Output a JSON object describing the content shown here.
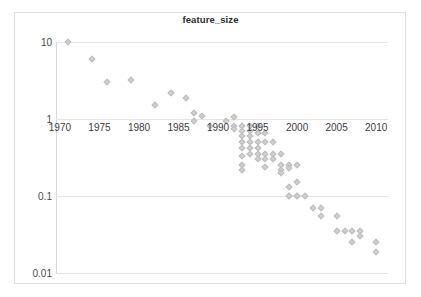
{
  "chart": {
    "title": "feature_size",
    "type": "scatter",
    "xlabel": "",
    "ylabel": "",
    "yscale": "log",
    "grid": true,
    "legend": "none"
  },
  "axes": {
    "x_ticks": [
      "1970",
      "1975",
      "1980",
      "1985",
      "1990",
      "1995",
      "2000",
      "2005",
      "2010"
    ],
    "x_tick_values": [
      1970,
      1975,
      1980,
      1985,
      1990,
      1995,
      2000,
      2005,
      2010
    ],
    "y_ticks": [
      "10",
      "1",
      "0.1",
      "0.01"
    ],
    "y_tick_values": [
      10,
      1,
      0.1,
      0.01
    ],
    "xlim": [
      1969.5,
      2011.5
    ],
    "ylim": [
      0.01,
      10
    ]
  },
  "style": {
    "marker_fill": "#cfcfcf",
    "marker_edge": "#bdbdbd",
    "gridline_color": "#e6e6e6",
    "axis_color": "#d8d8d8",
    "frame_color": "#e2e2e2",
    "title_color": "#2b2b2b",
    "tick_label_color": "#4a4a4a",
    "background": "#ffffff"
  },
  "chart_data": {
    "type": "scatter",
    "title": "feature_size",
    "xlabel": "",
    "ylabel": "",
    "yscale": "log",
    "grid": true,
    "legend": "none",
    "xlim": [
      1969.5,
      2011.5
    ],
    "ylim": [
      0.01,
      10
    ],
    "x_tick_labels": [
      "1970",
      "1975",
      "1980",
      "1985",
      "1990",
      "1995",
      "2000",
      "2005",
      "2010"
    ],
    "y_tick_labels": [
      "10",
      "1",
      "0.1",
      "0.01"
    ],
    "points": [
      [
        1971,
        10.0
      ],
      [
        1974,
        6.0
      ],
      [
        1976,
        3.0
      ],
      [
        1979,
        3.2
      ],
      [
        1982,
        1.5
      ],
      [
        1984,
        2.2
      ],
      [
        1986,
        1.9
      ],
      [
        1987,
        1.2
      ],
      [
        1987,
        0.95
      ],
      [
        1988,
        1.1
      ],
      [
        1989,
        0.8
      ],
      [
        1991,
        0.95
      ],
      [
        1992,
        1.05
      ],
      [
        1992,
        0.8
      ],
      [
        1992,
        0.75
      ],
      [
        1993,
        0.8
      ],
      [
        1993,
        0.7
      ],
      [
        1993,
        0.6
      ],
      [
        1993,
        0.5
      ],
      [
        1993,
        0.42
      ],
      [
        1993,
        0.33
      ],
      [
        1993,
        0.25
      ],
      [
        1993,
        0.22
      ],
      [
        1994,
        0.8
      ],
      [
        1994,
        0.7
      ],
      [
        1994,
        0.6
      ],
      [
        1994,
        0.5
      ],
      [
        1994,
        0.42
      ],
      [
        1994,
        0.35
      ],
      [
        1995,
        0.8
      ],
      [
        1995,
        0.65
      ],
      [
        1995,
        0.5
      ],
      [
        1995,
        0.42
      ],
      [
        1995,
        0.35
      ],
      [
        1995,
        0.3
      ],
      [
        1996,
        0.65
      ],
      [
        1996,
        0.5
      ],
      [
        1996,
        0.35
      ],
      [
        1996,
        0.3
      ],
      [
        1996,
        0.24
      ],
      [
        1997,
        0.5
      ],
      [
        1997,
        0.35
      ],
      [
        1997,
        0.3
      ],
      [
        1998,
        0.35
      ],
      [
        1998,
        0.25
      ],
      [
        1998,
        0.22
      ],
      [
        1998,
        0.2
      ],
      [
        1999,
        0.25
      ],
      [
        1999,
        0.23
      ],
      [
        1999,
        0.13
      ],
      [
        1999,
        0.1
      ],
      [
        1999,
        0.1
      ],
      [
        2000,
        0.25
      ],
      [
        2000,
        0.15
      ],
      [
        2000,
        0.1
      ],
      [
        2000,
        0.1
      ],
      [
        2001,
        0.1
      ],
      [
        2002,
        0.07
      ],
      [
        2003,
        0.07
      ],
      [
        2003,
        0.055
      ],
      [
        2005,
        0.055
      ],
      [
        2005,
        0.035
      ],
      [
        2006,
        0.035
      ],
      [
        2007,
        0.035
      ],
      [
        2007,
        0.025
      ],
      [
        2008,
        0.035
      ],
      [
        2008,
        0.03
      ],
      [
        2010,
        0.025
      ],
      [
        2010,
        0.019
      ]
    ]
  }
}
